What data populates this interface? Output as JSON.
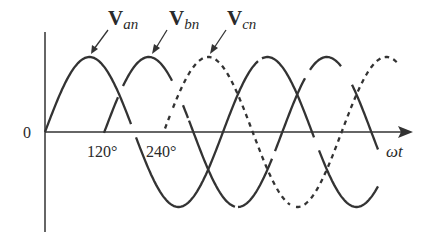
{
  "diagram": {
    "origin_label": "0",
    "x_axis_label": "ωt",
    "ticks": [
      {
        "label": "120°",
        "degrees": 120
      },
      {
        "label": "240°",
        "degrees": 240
      }
    ],
    "phases": [
      {
        "id": "an",
        "label_main": "V",
        "label_sub": "an",
        "phase_shift_deg": 0,
        "style": "solid"
      },
      {
        "id": "bn",
        "label_main": "V",
        "label_sub": "bn",
        "phase_shift_deg": 120,
        "style": "solid"
      },
      {
        "id": "cn",
        "label_main": "V",
        "label_sub": "cn",
        "phase_shift_deg": 240,
        "style": "dashed"
      }
    ],
    "colors": {
      "stroke": "#333333",
      "background": "#ffffff"
    }
  }
}
